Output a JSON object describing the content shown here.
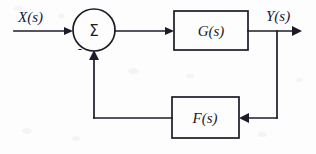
{
  "diagram": {
    "type": "control-system-block-diagram",
    "background_color": "#fdfdfd",
    "line_color": "#1c1c28",
    "label_color": "#17173a",
    "input": {
      "label": "X(s)",
      "label_x": 18,
      "label_y": 22,
      "line_from_x": 14,
      "line_to_x": 73,
      "line_y": 31
    },
    "summing_junction": {
      "symbol": "Σ",
      "center_x": 94,
      "center_y": 30,
      "radius": 21,
      "feedback_sign": "-",
      "sign_x": 80,
      "sign_y": 52
    },
    "forward_block": {
      "label": "G(s)",
      "x": 174,
      "y": 11,
      "width": 74,
      "height": 39
    },
    "feedback_block": {
      "label": "F(s)",
      "x": 172,
      "y": 97,
      "width": 67,
      "height": 41
    },
    "output": {
      "label": "Y(s)",
      "label_x": 266,
      "label_y": 21,
      "line_from_x": 248,
      "line_to_x": 302,
      "line_y": 31,
      "tap_x": 277
    },
    "feedback_path": {
      "tap_x": 277,
      "tap_y_top": 31,
      "bottom_y": 118,
      "return_x": 94,
      "return_y_top": 50
    },
    "connections": [
      {
        "name": "input-to-summer",
        "from": "X(s)",
        "to": "Σ"
      },
      {
        "name": "summer-to-forward-block",
        "from": "Σ",
        "to": "G(s)"
      },
      {
        "name": "forward-block-to-output",
        "from": "G(s)",
        "to": "Y(s)"
      },
      {
        "name": "output-tap-to-feedback-block",
        "from": "Y(s)",
        "to": "F(s)"
      },
      {
        "name": "feedback-block-to-summer",
        "from": "F(s)",
        "to": "Σ"
      }
    ]
  }
}
